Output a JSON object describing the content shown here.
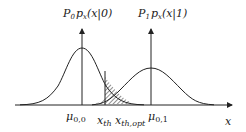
{
  "diagram": {
    "type": "two-gaussian-decision-threshold",
    "curve_left_label": {
      "P": "P",
      "P_sub": "0",
      "p": "p",
      "p_sub": "x",
      "arg": "(x|0)"
    },
    "curve_right_label": {
      "P": "P",
      "P_sub": "1",
      "p": "p",
      "p_sub": "x",
      "arg": "(x|1)"
    },
    "axis_labels": {
      "mu_left": {
        "base": "μ",
        "sub": "0,0"
      },
      "mu_right": {
        "base": "μ",
        "sub": "0,1"
      },
      "x_th": {
        "base": "x",
        "sub": "th"
      },
      "x_th_opt": {
        "base": "x",
        "sub": "th,opt"
      },
      "x_axis": "x"
    },
    "colors": {
      "stroke": "#222222",
      "background": "#ffffff"
    }
  }
}
